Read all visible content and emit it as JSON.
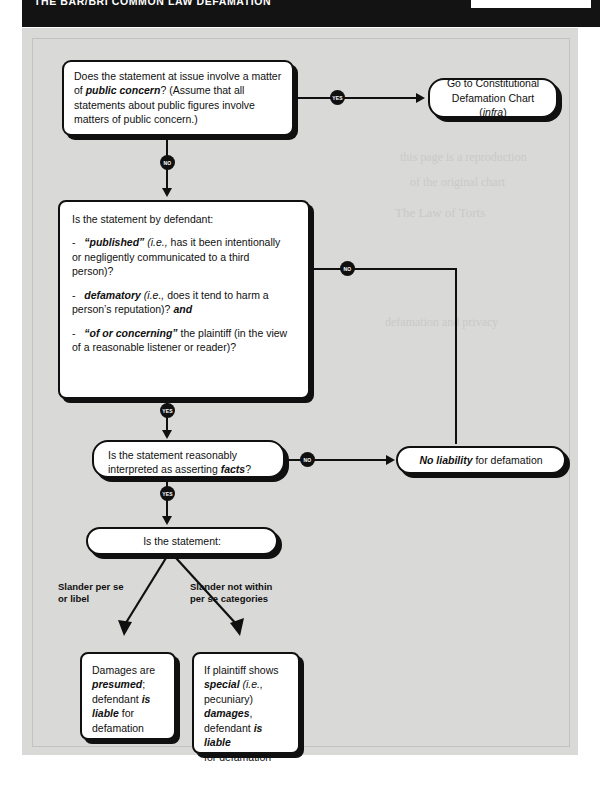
{
  "header": {
    "title": "THE BAR/BRI COMMON LAW DEFAMATION",
    "tab_label": ""
  },
  "ghost_text": [
    "this page is a reproduction",
    "of the original chart",
    "The Law of Torts",
    "defamation and privacy"
  ],
  "chart_title": "Common Law Defamation Flow Chart",
  "nodes": {
    "q_public_concern": {
      "line1": "Does the statement at issue involve a matter",
      "line2_pre": "of ",
      "line2_bold": "public concern",
      "line2_post": "? (Assume that all",
      "line3": "statements about public figures involve",
      "line4": "matters of public concern.)"
    },
    "goto_constitutional": {
      "line1": "Go to Constitutional",
      "line2_pre": "Defamation Chart (",
      "line2_ital": "infra",
      "line2_post": ")"
    },
    "q_elements": {
      "heading": "Is the statement by defendant:",
      "b1_dash": "-",
      "b1_bold": "“published”",
      "b1_ital": "(i.e.,",
      "b1_rest": " has it been intentionally",
      "b1_line2": "or negligently communicated to a third",
      "b1_line3": "person)?",
      "b2_dash": "-",
      "b2_bold": "defamatory",
      "b2_ital": "(i.e.,",
      "b2_rest": " does it tend to harm a",
      "b2_line2_pre": "person’s reputation)? ",
      "b2_line2_bold": "and",
      "b3_dash": "-",
      "b3_bold": "“of or concerning”",
      "b3_rest": " the plaintiff (in the view",
      "b3_line2": "of a reasonable listener or reader)?"
    },
    "q_facts": {
      "line1": "Is the statement reasonably",
      "line2_pre": "interpreted as asserting ",
      "line2_bold": "facts",
      "line2_post": "?"
    },
    "no_liability": {
      "bold": "No liability",
      "rest": " for defamation"
    },
    "q_is_statement": {
      "text": "Is the statement:"
    },
    "damages_presumed": {
      "l1": "Damages are",
      "l2_bold": "presumed",
      "l2_post": ";",
      "l3_pre": "defendant ",
      "l3_bold": "is",
      "l4_bold": "liable",
      "l4_post": " for",
      "l5": "defamation"
    },
    "special_damages": {
      "l1": "If plaintiff shows",
      "l2_bold": "special",
      "l2_ital": " (i.e.,",
      "l3": "pecuniary)",
      "l4_bold": "damages",
      "l4_post": ",",
      "l5_pre": "defendant ",
      "l5_bold": "is liable",
      "l6": "for defamation"
    }
  },
  "edges": {
    "yes1": "YES",
    "no1": "NO",
    "yes2": "YES",
    "no2": "NO",
    "yes3": "YES",
    "no3": "NO"
  },
  "branch_labels": {
    "left_l1": "Slander per se",
    "left_l2": "or libel",
    "right_l1": "Slander not within",
    "right_l2": "per se categories"
  },
  "colors": {
    "ink": "#101010",
    "panel": "#d9d9d7",
    "paper": "#ffffff"
  }
}
